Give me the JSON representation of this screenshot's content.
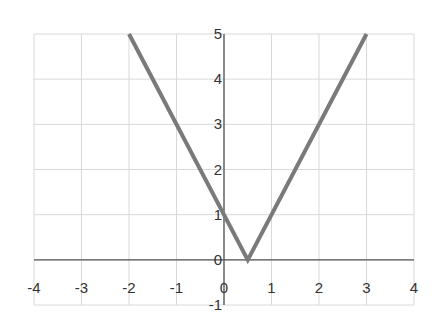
{
  "chart_data": {
    "type": "line",
    "title": "",
    "xlabel": "",
    "ylabel": "",
    "xlim": [
      -4,
      4
    ],
    "ylim": [
      -1,
      5
    ],
    "grid": true,
    "legend": null,
    "x_ticks": [
      "-4",
      "-3",
      "-2",
      "-1",
      "0",
      "1",
      "2",
      "3",
      "4"
    ],
    "y_ticks": [
      "-1",
      "0",
      "1",
      "2",
      "3",
      "4",
      "5"
    ],
    "series": [
      {
        "name": "y = |2x - 1|",
        "x": [
          -2,
          0.5,
          3
        ],
        "y": [
          5,
          0,
          5
        ],
        "color": "#7a7a7a"
      }
    ]
  },
  "colors": {
    "grid": "#d9d9d9",
    "axis": "#555555",
    "line": "#7a7a7a",
    "text": "#333333"
  }
}
